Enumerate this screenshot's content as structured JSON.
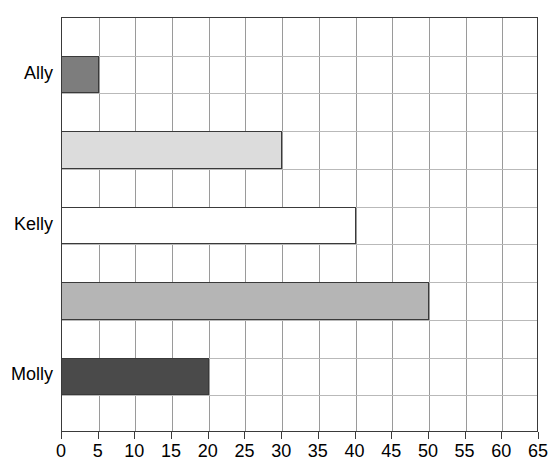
{
  "chart_data": {
    "type": "bar",
    "orientation": "horizontal",
    "title": "",
    "title_note": "title cropped off top edge of screenshot",
    "xlabel": "",
    "ylabel": "",
    "xlim": [
      0,
      65
    ],
    "xticks": [
      0,
      5,
      10,
      15,
      20,
      25,
      30,
      35,
      40,
      45,
      50,
      55,
      60,
      65
    ],
    "grid": true,
    "legend": "none",
    "categories": [
      "Ally",
      "",
      "Kelly",
      "",
      "Molly"
    ],
    "values": [
      5,
      30,
      40,
      50,
      20
    ],
    "bars": [
      {
        "label": "Ally",
        "value": 5,
        "fill": "#7d7d7d",
        "stroke": "#3a3a3a"
      },
      {
        "label": "",
        "value": 30,
        "fill": "#dcdcdc",
        "stroke": "#3a3a3a"
      },
      {
        "label": "Kelly",
        "value": 40,
        "fill": "#ffffff",
        "stroke": "#3a3a3a"
      },
      {
        "label": "",
        "value": 50,
        "fill": "#b5b5b5",
        "stroke": "#3a3a3a"
      },
      {
        "label": "Molly",
        "value": 20,
        "fill": "#4a4a4a",
        "stroke": "#3a3a3a"
      }
    ]
  },
  "axis": {
    "tick_labels": [
      "0",
      "5",
      "10",
      "15",
      "20",
      "25",
      "30",
      "35",
      "40",
      "45",
      "50",
      "55",
      "60",
      "65"
    ]
  },
  "colors": {
    "frame": "#3a3a3a",
    "vertical_gridline": "#9a9a9a",
    "horizontal_gridline": "#b9b9b9",
    "background": "#ffffff",
    "text": "#000000"
  }
}
